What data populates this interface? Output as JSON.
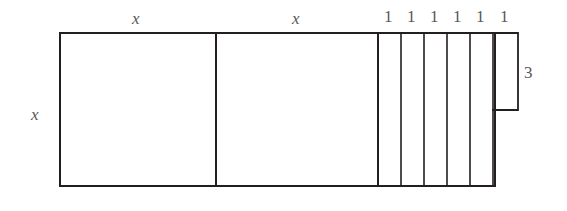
{
  "figure": {
    "type": "geometry-diagram",
    "background_color": "#ffffff",
    "line_color": "#231f20",
    "label_color": "#58585a",
    "outline": {
      "left": 60,
      "top": 33,
      "right": 495,
      "bottom": 186,
      "stroke_width": 2
    },
    "squares": [
      {
        "name": "square-1",
        "x0": 60,
        "x1": 216,
        "top": 33,
        "bottom": 186,
        "side_label": "x"
      },
      {
        "name": "square-2",
        "x0": 216,
        "x1": 378,
        "top": 33,
        "bottom": 186,
        "side_label": "x"
      }
    ],
    "strips": [
      {
        "name": "strip-1",
        "x0": 378,
        "x1": 401,
        "top": 33,
        "bottom": 186,
        "width_label": "1"
      },
      {
        "name": "strip-2",
        "x0": 401,
        "x1": 424,
        "top": 33,
        "bottom": 186,
        "width_label": "1"
      },
      {
        "name": "strip-3",
        "x0": 424,
        "x1": 447,
        "top": 33,
        "bottom": 186,
        "width_label": "1"
      },
      {
        "name": "strip-4",
        "x0": 447,
        "x1": 470,
        "top": 33,
        "bottom": 186,
        "width_label": "1"
      },
      {
        "name": "strip-5",
        "x0": 470,
        "x1": 493,
        "top": 33,
        "bottom": 186,
        "width_label": "1"
      },
      {
        "name": "strip-6",
        "x0": 493,
        "x1": 518,
        "top": 33,
        "bottom": 110,
        "width_label": "1",
        "height_label": "3"
      }
    ],
    "labels": {
      "top_square_1": "x",
      "top_square_2": "x",
      "left_side": "x",
      "strip_widths": [
        "1",
        "1",
        "1",
        "1",
        "1",
        "1"
      ],
      "notch_height": "3"
    },
    "label_positions": {
      "top_square_1": {
        "x": 132,
        "y": 10
      },
      "top_square_2": {
        "x": 292,
        "y": 10
      },
      "left_side": {
        "x": 31,
        "y": 106
      },
      "notch_height": {
        "x": 524,
        "y": 64
      },
      "strip_1": {
        "x": 384,
        "y": 8
      },
      "strip_2": {
        "x": 407,
        "y": 8
      },
      "strip_3": {
        "x": 430,
        "y": 8
      },
      "strip_4": {
        "x": 453,
        "y": 8
      },
      "strip_5": {
        "x": 476,
        "y": 8
      },
      "strip_6": {
        "x": 500,
        "y": 8
      }
    }
  }
}
